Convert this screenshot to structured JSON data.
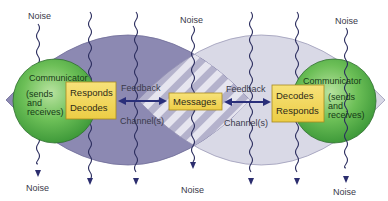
{
  "diagram": {
    "type": "communication-model",
    "left_communicator": {
      "title": "Communicator",
      "subtitle_lines": [
        "(sends",
        "and",
        "receives)"
      ],
      "box_lines": [
        "Responds",
        "Decodes"
      ]
    },
    "right_communicator": {
      "title": "Communicator",
      "subtitle_lines": [
        "(sends",
        "and",
        "receives)"
      ],
      "box_lines": [
        "Decodes",
        "Responds"
      ]
    },
    "center": {
      "label": "Messages"
    },
    "links": {
      "left": {
        "top_label": "Feedback",
        "bottom_label": "Channel(s)"
      },
      "right": {
        "top_label": "Feedback",
        "bottom_label": "Channel(s)"
      }
    },
    "noise_labels": {
      "top_left": "Noise",
      "top_center": "Noise",
      "top_right": "Noise",
      "bottom_left": "Noise",
      "bottom_center": "Noise",
      "bottom_right": "Noise"
    },
    "colors": {
      "left_lens": "#8c89b2",
      "right_lens": "#d9d9e6",
      "overlap_stripe_a": "#b7b5cf",
      "overlap_stripe_b": "#e4e3ee",
      "communicator_green": "#6fbf5a",
      "box_yellow": "#f3dc5e",
      "arrow_navy": "#2a2f7a",
      "noise_line": "#2b2d5e"
    }
  }
}
